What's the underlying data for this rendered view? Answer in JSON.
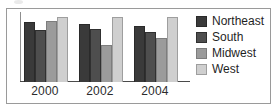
{
  "chart_data": {
    "type": "bar",
    "title": "",
    "xlabel": "",
    "ylabel": "",
    "categories": [
      "2000",
      "2002",
      "2004"
    ],
    "series": [
      {
        "name": "Northeast",
        "color": "#3a3a3a",
        "values": [
          61,
          59,
          57
        ]
      },
      {
        "name": "South",
        "color": "#4e4e4e",
        "values": [
          53,
          54,
          51
        ]
      },
      {
        "name": "Midwest",
        "color": "#9b9b9b",
        "values": [
          62,
          38,
          45
        ]
      },
      {
        "name": "West",
        "color": "#cfcfcf",
        "values": [
          66,
          66,
          66
        ]
      }
    ],
    "ylim": [
      0,
      70
    ],
    "grid": false,
    "legend_position": "right",
    "axis": {
      "baseline_visible": true,
      "left_spine_visible": true
    }
  },
  "legend": {
    "items": [
      {
        "label": "Northeast"
      },
      {
        "label": "South"
      },
      {
        "label": "Midwest"
      },
      {
        "label": "West"
      }
    ]
  }
}
